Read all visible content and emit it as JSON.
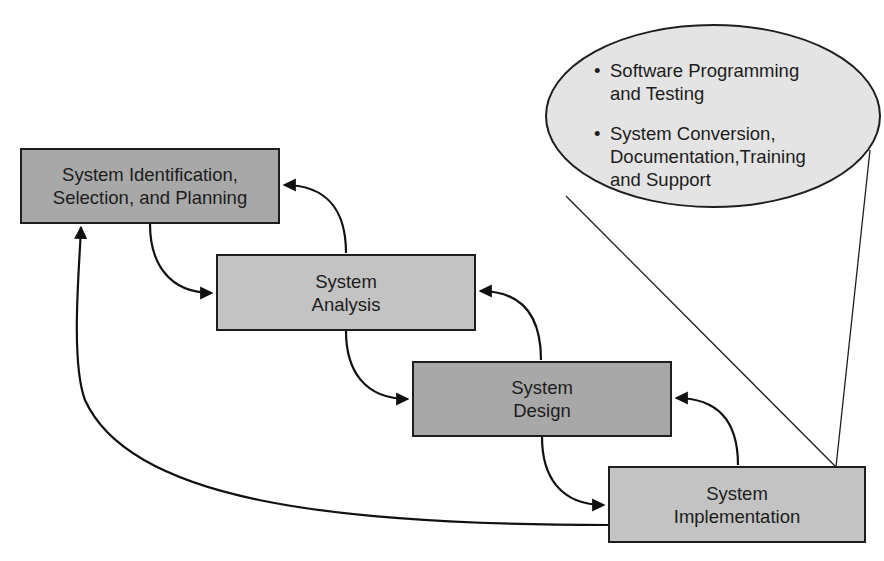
{
  "diagram": {
    "type": "system-development-life-cycle",
    "stages": [
      {
        "id": "planning",
        "lines": [
          "System Identification,",
          "Selection, and Planning"
        ]
      },
      {
        "id": "analysis",
        "lines": [
          "System",
          "Analysis"
        ]
      },
      {
        "id": "design",
        "lines": [
          "System",
          "Design"
        ]
      },
      {
        "id": "implementation",
        "lines": [
          "System",
          "Implementation"
        ]
      }
    ],
    "callout": {
      "attached_to": "implementation",
      "bullet": "•",
      "items": [
        {
          "lines": [
            "Software Programming",
            "and Testing"
          ]
        },
        {
          "lines": [
            "System Conversion,",
            "Documentation,Training",
            "and Support"
          ]
        }
      ]
    },
    "edges": [
      {
        "from": "planning",
        "to": "analysis",
        "direction": "forward"
      },
      {
        "from": "analysis",
        "to": "design",
        "direction": "forward"
      },
      {
        "from": "design",
        "to": "implementation",
        "direction": "forward"
      },
      {
        "from": "analysis",
        "to": "planning",
        "direction": "back"
      },
      {
        "from": "design",
        "to": "analysis",
        "direction": "back"
      },
      {
        "from": "implementation",
        "to": "design",
        "direction": "back"
      },
      {
        "from": "implementation",
        "to": "planning",
        "direction": "back"
      }
    ],
    "colors": {
      "box_dark": "#a8a8a8",
      "box_light": "#c3c3c3",
      "callout_fill": "#e4e4e4",
      "stroke": "#1e1e1e"
    }
  }
}
